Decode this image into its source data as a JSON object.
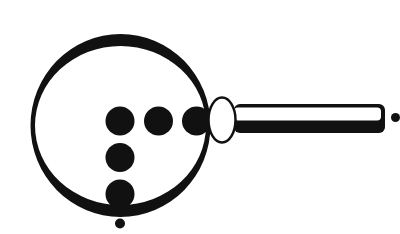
{
  "illustration": {
    "subject": "magnifying glass with dots",
    "background": "#ffffff",
    "ink": "#111111",
    "lens_fill": "#ffffff",
    "lens": {
      "outer": {
        "cx": 120.5,
        "cy": 125.5,
        "rx": 90,
        "ry": 91.5
      },
      "inner": {
        "cx": 120.5,
        "cy": 125.5,
        "rx": 85.5,
        "ry": 79.5
      }
    },
    "connector": {
      "cx": 222,
      "cy": 120,
      "rx": 13.5,
      "ry": 22.5,
      "stroke_width": 2.5
    },
    "handle": {
      "x": 234,
      "y": 104,
      "width": 151,
      "height": 29,
      "corner_radius": 6,
      "highlight": {
        "x": 234,
        "y": 107.5,
        "width": 147,
        "height": 13,
        "corner_radius": 4
      }
    },
    "dots": [
      {
        "cx": 120,
        "cy": 121,
        "r": 14.5
      },
      {
        "cx": 158.5,
        "cy": 121,
        "r": 14.5
      },
      {
        "cx": 196.5,
        "cy": 121,
        "r": 14.5
      },
      {
        "cx": 120,
        "cy": 157.5,
        "r": 14.5
      },
      {
        "cx": 120,
        "cy": 194,
        "r": 14.5
      }
    ],
    "small_dots": [
      {
        "cx": 120,
        "cy": 223.5,
        "r": 5
      },
      {
        "cx": 395.5,
        "cy": 117.5,
        "r": 4.5
      }
    ]
  }
}
